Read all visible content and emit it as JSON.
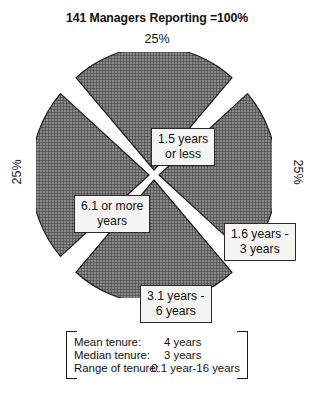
{
  "chart_data": {
    "type": "pie",
    "title": "141 Managers Reporting =100%",
    "categories": [
      "1.5 years or less",
      "1.6 years - 3 years",
      "3.1 years - 6 years",
      "6.1 or more years"
    ],
    "values": [
      25,
      25,
      25,
      25
    ],
    "value_labels": [
      "25%",
      "25%",
      "25%",
      "25%"
    ],
    "slices": [
      {
        "label_line1": "1.5 years",
        "label_line2": "or less",
        "value": 25,
        "value_label": "25%",
        "position": "top"
      },
      {
        "label_line1": "1.6 years -",
        "label_line2": "3 years",
        "value": 25,
        "value_label": "25%",
        "position": "right"
      },
      {
        "label_line1": "3.1 years -",
        "label_line2": "6 years",
        "value": 25,
        "value_label": "25%",
        "position": "bottom"
      },
      {
        "label_line1": "6.1 or more",
        "label_line2": "years",
        "value": 25,
        "value_label": "25%",
        "position": "left"
      }
    ],
    "xlabel": "",
    "ylabel": "",
    "legend_position": "none",
    "grid": false,
    "colors": {
      "slice_fill": "#7a7a7a",
      "slice_hatch": "#3b3b3b",
      "slice_outline": "#1a1a1a",
      "label_background": "#f4f4f2",
      "label_border": "#2a2a2a",
      "background": "#ffffff",
      "text": "#111111"
    }
  },
  "pct_labels": {
    "top": "25%",
    "right": "25%",
    "bottom": "25%",
    "left": "25%"
  },
  "summary": {
    "rows": [
      {
        "label": "Mean tenure:",
        "value": "4 years"
      },
      {
        "label": "Median tenure:",
        "value": "3 years"
      },
      {
        "label": "Range of tenure:",
        "value": "0.1 year-16 years"
      }
    ]
  }
}
